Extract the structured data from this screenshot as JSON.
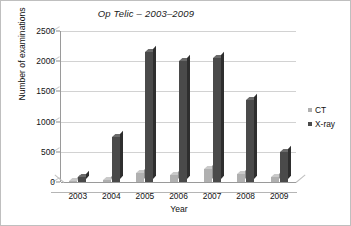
{
  "chart_data": {
    "type": "bar",
    "title": "Op Telic – 2003–2009",
    "xlabel": "Year",
    "ylabel": "Number of examinations",
    "categories": [
      "2003",
      "2004",
      "2005",
      "2006",
      "2007",
      "2008",
      "2009"
    ],
    "series": [
      {
        "name": "CT",
        "color": "#b0b0b0",
        "values": [
          20,
          30,
          150,
          110,
          220,
          140,
          80
        ]
      },
      {
        "name": "X-ray",
        "color": "#4a4a4a",
        "values": [
          90,
          750,
          2150,
          2000,
          2050,
          1350,
          500
        ]
      }
    ],
    "ylim": [
      0,
      2500
    ],
    "yticks": [
      0,
      500,
      1000,
      1500,
      2000,
      2500
    ],
    "ytick_labels": [
      "0",
      "500",
      "1000",
      "1500",
      "2000",
      "2500"
    ],
    "grid": true,
    "legend_position": "right",
    "style": "3d-column"
  },
  "legend": {
    "entries": [
      {
        "label": "CT",
        "swatch": "#b0b0b0"
      },
      {
        "label": "X-ray",
        "swatch": "#4a4a4a"
      }
    ]
  }
}
